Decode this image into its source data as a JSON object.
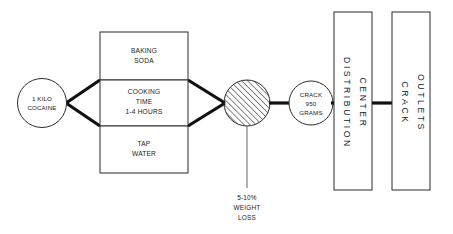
{
  "diagram": {
    "type": "flow-diagram",
    "background_color": "#ffffff",
    "line_color": "#111111",
    "outline_color": "#2b2b2b",
    "text_color": "#1a1a1a"
  },
  "nodes": {
    "input_circle": {
      "shape": "circle",
      "lines": [
        "1 KILO",
        "COCAINE"
      ]
    },
    "ingredient_top": {
      "shape": "rectangle",
      "lines": [
        "BAKING",
        "SODA"
      ]
    },
    "ingredient_middle": {
      "shape": "rectangle",
      "lines": [
        "COOKING",
        "TIME",
        "1-4 HOURS"
      ]
    },
    "ingredient_bottom": {
      "shape": "rectangle",
      "lines": [
        "TAP",
        "WATER"
      ]
    },
    "process_circle": {
      "shape": "circle-hatched",
      "lines": []
    },
    "loss_note": {
      "shape": "callout",
      "lines": [
        "5-10%",
        "WEIGHT",
        "LOSS"
      ]
    },
    "output_circle": {
      "shape": "circle",
      "lines": [
        "CRACK",
        "950",
        "GRAMS"
      ]
    },
    "distribution_box": {
      "shape": "tall-rectangle",
      "columns": [
        "DISTRIBUTION",
        "CENTER"
      ]
    },
    "outlets_box": {
      "shape": "tall-rectangle",
      "columns": [
        "CRACK",
        "OUTLETS"
      ]
    }
  }
}
